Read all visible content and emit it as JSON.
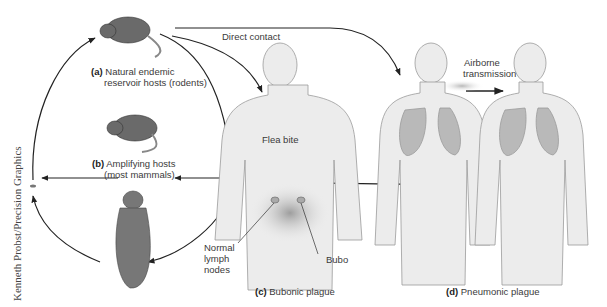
{
  "figure": {
    "labels": {
      "a_letter": "(a)",
      "a_line1": "Natural endemic",
      "a_line2": "reservoir hosts (rodents)",
      "b_letter": "(b)",
      "b_line1": "Amplifying hosts",
      "b_line2": "(most mammals)",
      "c_letter": "(c)",
      "c_text": "Bubonic plague",
      "d_letter": "(d)",
      "d_text": "Pneumonic plague",
      "direct_contact": "Direct contact",
      "flea_bite": "Flea bite",
      "airborne_line1": "Airborne",
      "airborne_line2": "transmission",
      "normal_lymph_1": "Normal",
      "normal_lymph_2": "lymph",
      "normal_lymph_3": "nodes",
      "bubo": "Bubo"
    },
    "credit": "Kenneth Probst/Precision Graphics",
    "colors": {
      "line": "#222222",
      "body_fill": "#ececec",
      "body_stroke": "#9a9a9a",
      "lung_fill": "#b9b9b9",
      "rodent": "#6a6a6a"
    }
  }
}
